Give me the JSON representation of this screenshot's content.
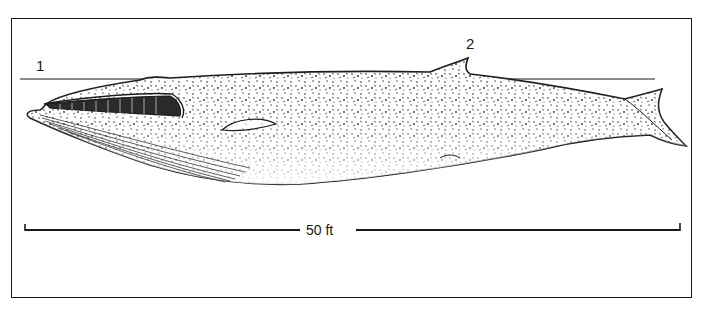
{
  "figure": {
    "labels": [
      {
        "id": "1",
        "text": "1"
      },
      {
        "id": "2",
        "text": "2"
      }
    ],
    "scale_bar": {
      "text": "50 ft"
    },
    "colors": {
      "ink": "#1a1a1a",
      "paper": "#ffffff"
    }
  }
}
